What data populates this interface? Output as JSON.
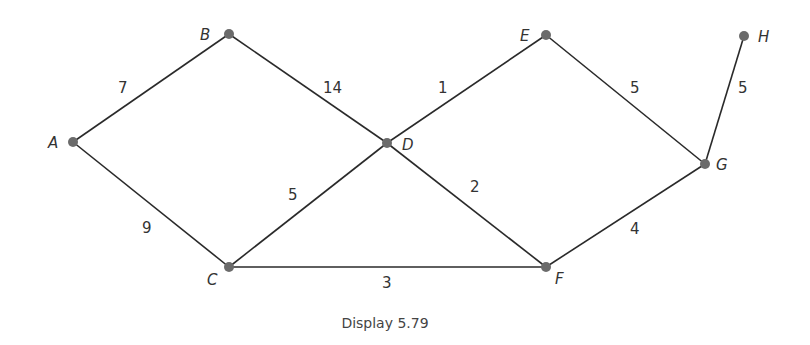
{
  "caption": "Display 5.79",
  "nodes": [
    {
      "id": "A",
      "x": 73,
      "y": 142,
      "lx": 48,
      "ly": 148
    },
    {
      "id": "B",
      "x": 229,
      "y": 34,
      "lx": 200,
      "ly": 40
    },
    {
      "id": "C",
      "x": 229,
      "y": 267,
      "lx": 207,
      "ly": 285
    },
    {
      "id": "D",
      "x": 387,
      "y": 143,
      "lx": 402,
      "ly": 150
    },
    {
      "id": "E",
      "x": 546,
      "y": 35,
      "lx": 520,
      "ly": 41
    },
    {
      "id": "F",
      "x": 546,
      "y": 267,
      "lx": 555,
      "ly": 284
    },
    {
      "id": "G",
      "x": 705,
      "y": 164,
      "lx": 716,
      "ly": 170
    },
    {
      "id": "H",
      "x": 744,
      "y": 36,
      "lx": 758,
      "ly": 42
    }
  ],
  "edges": [
    {
      "from": "A",
      "to": "B",
      "weight": "7",
      "lx": 118,
      "ly": 93
    },
    {
      "from": "B",
      "to": "D",
      "weight": "14",
      "lx": 323,
      "ly": 93
    },
    {
      "from": "A",
      "to": "C",
      "weight": "9",
      "lx": 142,
      "ly": 233
    },
    {
      "from": "C",
      "to": "D",
      "weight": "5",
      "lx": 288,
      "ly": 200
    },
    {
      "from": "D",
      "to": "E",
      "weight": "1",
      "lx": 438,
      "ly": 93
    },
    {
      "from": "D",
      "to": "F",
      "weight": "2",
      "lx": 470,
      "ly": 192
    },
    {
      "from": "C",
      "to": "F",
      "weight": "3",
      "lx": 382,
      "ly": 288
    },
    {
      "from": "E",
      "to": "G",
      "weight": "5",
      "lx": 630,
      "ly": 93
    },
    {
      "from": "F",
      "to": "G",
      "weight": "4",
      "lx": 630,
      "ly": 234
    },
    {
      "from": "G",
      "to": "H",
      "weight": "5",
      "lx": 738,
      "ly": 93
    }
  ]
}
